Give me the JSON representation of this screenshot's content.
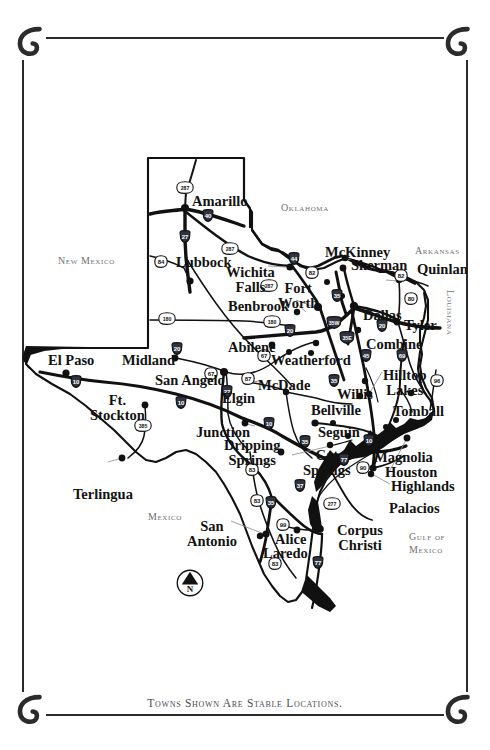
{
  "document": {
    "title": "Texas Map — Towns Shown Are Stable Locations",
    "caption": "Towns Shown Are Stable Locations.",
    "background_color": "#ffffff",
    "ink_color": "#121212",
    "label_gray": "#6f6f72"
  },
  "frame": {
    "ornament": "horseshoe",
    "corners": [
      "top-left",
      "top-right",
      "bottom-left",
      "bottom-right"
    ]
  },
  "compass": {
    "label": "N",
    "type": "north-arrow"
  },
  "regions": [
    {
      "name": "New Mexico",
      "label": "New Mexico",
      "x": 58,
      "y": 256,
      "rotate": 0
    },
    {
      "name": "Oklahoma",
      "label": "Oklahoma",
      "x": 281,
      "y": 203,
      "rotate": 0
    },
    {
      "name": "Arkansas",
      "label": "Arkansas",
      "x": 415,
      "y": 246,
      "rotate": 0
    },
    {
      "name": "Louisiana",
      "label": "Louisiana",
      "x": 455,
      "y": 290,
      "rotate": 90
    },
    {
      "name": "Mexico",
      "label": "Mexico",
      "x": 148,
      "y": 512,
      "rotate": 0
    },
    {
      "name": "Gulf of Mexico",
      "label": "Gulf of",
      "x": 409,
      "y": 532,
      "rotate": 0
    },
    {
      "name": "Gulf of Mexico2",
      "label": "Mexico",
      "x": 409,
      "y": 545,
      "rotate": 0
    }
  ],
  "cities": [
    {
      "name": "Amarillo",
      "label": "Amarillo",
      "lx": 192,
      "ly": 194,
      "dx": 185,
      "dy": 208
    },
    {
      "name": "Lubbock",
      "label": "Lubbock",
      "lx": 176,
      "ly": 255,
      "dx": 190,
      "dy": 281
    },
    {
      "name": "Wichita Falls",
      "label": "Wichita\nFalls",
      "lx": 226,
      "ly": 265,
      "dx": 290,
      "dy": 267
    },
    {
      "name": "Fort Worth",
      "label": "Fort\nWorth",
      "lx": 278,
      "ly": 281,
      "dx": 318,
      "dy": 307
    },
    {
      "name": "Benbrook",
      "label": "Benbrook",
      "lx": 228,
      "ly": 299,
      "dx": 297,
      "dy": 312
    },
    {
      "name": "McKinney",
      "label": "McKinney",
      "lx": 325,
      "ly": 245,
      "dx": 343,
      "dy": 268
    },
    {
      "name": "Sherman",
      "label": "Sherman",
      "lx": 351,
      "ly": 258,
      "dx": 345,
      "dy": 258
    },
    {
      "name": "Quinlan",
      "label": "Quinlan",
      "lx": 417,
      "ly": 262,
      "dx": 399,
      "dy": 280
    },
    {
      "name": "Dallas",
      "label": "Dallas",
      "lx": 363,
      "ly": 308,
      "dx": 354,
      "dy": 306
    },
    {
      "name": "Tyler",
      "label": "Tyler",
      "lx": 404,
      "ly": 318,
      "dx": 397,
      "dy": 322
    },
    {
      "name": "Combine",
      "label": "Combine",
      "lx": 366,
      "ly": 337,
      "dx": 358,
      "dy": 330
    },
    {
      "name": "El Paso",
      "label": "El Paso",
      "lx": 48,
      "ly": 353,
      "dx": 66,
      "dy": 373
    },
    {
      "name": "Midland",
      "label": "Midland",
      "lx": 122,
      "ly": 353,
      "dx": 175,
      "dy": 358
    },
    {
      "name": "Abilene",
      "label": "Abilene",
      "lx": 228,
      "ly": 340,
      "dx": 272,
      "dy": 345
    },
    {
      "name": "Weatherford",
      "label": "Weatherford",
      "lx": 271,
      "ly": 353,
      "dx": 316,
      "dy": 343
    },
    {
      "name": "San Angelo",
      "label": "San Angelo",
      "lx": 155,
      "ly": 373,
      "dx": 224,
      "dy": 372
    },
    {
      "name": "McDade",
      "label": "McDade",
      "lx": 258,
      "ly": 378,
      "dx": 248,
      "dy": 380
    },
    {
      "name": "Elgin",
      "label": "Elgin",
      "lx": 222,
      "ly": 391,
      "dx": 286,
      "dy": 392
    },
    {
      "name": "Willis",
      "label": "Willis",
      "lx": 337,
      "ly": 387,
      "dx": 365,
      "dy": 381
    },
    {
      "name": "Hilltop Lakes",
      "label": "Hilltop\nLakes",
      "lx": 383,
      "ly": 368,
      "dx": 369,
      "dy": 394
    },
    {
      "name": "Bellville",
      "label": "Bellville",
      "lx": 311,
      "ly": 403,
      "dx": 360,
      "dy": 396
    },
    {
      "name": "Tomball",
      "label": "Tomball",
      "lx": 393,
      "ly": 404,
      "dx": 411,
      "dy": 393
    },
    {
      "name": "Ft. Stockton",
      "label": "Ft.\nStockton",
      "lx": 90,
      "ly": 393,
      "dx": 145,
      "dy": 405
    },
    {
      "name": "Junction",
      "label": "Junction",
      "lx": 196,
      "ly": 425,
      "dx": 245,
      "dy": 423
    },
    {
      "name": "Dripping Springs",
      "label": "Dripping\nSprings",
      "lx": 224,
      "ly": 438,
      "dx": 281,
      "dy": 452
    },
    {
      "name": "Seguin",
      "label": "Seguin",
      "lx": 318,
      "ly": 425,
      "dx": 315,
      "dy": 423
    },
    {
      "name": "Cat Springs",
      "label": "Cat\nSprings",
      "lx": 303,
      "ly": 448,
      "dx": 330,
      "dy": 445
    },
    {
      "name": "Magnolia",
      "label": "Magnolia",
      "lx": 374,
      "ly": 450,
      "dx": 352,
      "dy": 452
    },
    {
      "name": "Houston",
      "label": "Houston",
      "lx": 385,
      "ly": 465,
      "dx": 373,
      "dy": 468
    },
    {
      "name": "Highlands",
      "label": "Highlands",
      "lx": 391,
      "ly": 479,
      "dx": 407,
      "dy": 438
    },
    {
      "name": "Palacios",
      "label": "Palacios",
      "lx": 389,
      "ly": 501,
      "dx": 371,
      "dy": 474
    },
    {
      "name": "Terlingua",
      "label": "Terlingua",
      "lx": 73,
      "ly": 487,
      "dx": 122,
      "dy": 458
    },
    {
      "name": "San Antonio",
      "label": "San\nAntonio",
      "lx": 187,
      "ly": 519,
      "dx": 266,
      "dy": 534
    },
    {
      "name": "Alice",
      "label": "Alice",
      "lx": 275,
      "ly": 532,
      "dx": 297,
      "dy": 530
    },
    {
      "name": "Laredo",
      "label": "Laredo",
      "lx": 263,
      "ly": 546,
      "dx": 260,
      "dy": 536
    },
    {
      "name": "Corpus Christi",
      "label": "Corpus\nChristi",
      "lx": 337,
      "ly": 523,
      "dx": 320,
      "dy": 529
    }
  ],
  "highway_shields": [
    {
      "type": "us",
      "number": "287",
      "x": 185,
      "y": 187
    },
    {
      "type": "interstate",
      "number": "40",
      "x": 208,
      "y": 215
    },
    {
      "type": "interstate",
      "number": "27",
      "x": 185,
      "y": 236
    },
    {
      "type": "us",
      "number": "84",
      "x": 161,
      "y": 261
    },
    {
      "type": "us",
      "number": "287",
      "x": 230,
      "y": 248
    },
    {
      "type": "interstate",
      "number": "44",
      "x": 294,
      "y": 258
    },
    {
      "type": "us",
      "number": "82",
      "x": 312,
      "y": 272
    },
    {
      "type": "us",
      "number": "82",
      "x": 401,
      "y": 275
    },
    {
      "type": "us",
      "number": "287",
      "x": 269,
      "y": 285
    },
    {
      "type": "interstate",
      "number": "35",
      "x": 337,
      "y": 295
    },
    {
      "type": "us",
      "number": "80",
      "x": 411,
      "y": 298
    },
    {
      "type": "us",
      "number": "180",
      "x": 167,
      "y": 318
    },
    {
      "type": "us",
      "number": "180",
      "x": 272,
      "y": 321
    },
    {
      "type": "interstate",
      "number": "20",
      "x": 290,
      "y": 330
    },
    {
      "type": "interstate",
      "number": "35W",
      "x": 334,
      "y": 322
    },
    {
      "type": "interstate",
      "number": "35E",
      "x": 347,
      "y": 337
    },
    {
      "type": "interstate",
      "number": "20",
      "x": 382,
      "y": 325
    },
    {
      "type": "interstate",
      "number": "20",
      "x": 177,
      "y": 348
    },
    {
      "type": "us",
      "number": "67",
      "x": 264,
      "y": 355
    },
    {
      "type": "us",
      "number": "67",
      "x": 211,
      "y": 373
    },
    {
      "type": "us",
      "number": "87",
      "x": 248,
      "y": 378
    },
    {
      "type": "interstate",
      "number": "45",
      "x": 366,
      "y": 355
    },
    {
      "type": "interstate",
      "number": "69",
      "x": 402,
      "y": 355
    },
    {
      "type": "interstate",
      "number": "35",
      "x": 334,
      "y": 380
    },
    {
      "type": "us",
      "number": "96",
      "x": 437,
      "y": 380
    },
    {
      "type": "interstate",
      "number": "27",
      "x": 227,
      "y": 391
    },
    {
      "type": "interstate",
      "number": "10",
      "x": 76,
      "y": 381
    },
    {
      "type": "interstate",
      "number": "10",
      "x": 181,
      "y": 402
    },
    {
      "type": "us",
      "number": "385",
      "x": 143,
      "y": 425
    },
    {
      "type": "interstate",
      "number": "10",
      "x": 269,
      "y": 423
    },
    {
      "type": "interstate",
      "number": "35",
      "x": 305,
      "y": 441
    },
    {
      "type": "interstate",
      "number": "10",
      "x": 369,
      "y": 440
    },
    {
      "type": "interstate",
      "number": "77",
      "x": 344,
      "y": 459
    },
    {
      "type": "us",
      "number": "90",
      "x": 363,
      "y": 467
    },
    {
      "type": "us",
      "number": "83",
      "x": 252,
      "y": 469
    },
    {
      "type": "interstate",
      "number": "37",
      "x": 300,
      "y": 485
    },
    {
      "type": "us",
      "number": "277",
      "x": 332,
      "y": 503
    },
    {
      "type": "us",
      "number": "83",
      "x": 257,
      "y": 500
    },
    {
      "type": "interstate",
      "number": "35",
      "x": 271,
      "y": 502
    },
    {
      "type": "us",
      "number": "99",
      "x": 283,
      "y": 524
    },
    {
      "type": "us",
      "number": "83",
      "x": 275,
      "y": 563
    },
    {
      "type": "interstate",
      "number": "77",
      "x": 318,
      "y": 562
    }
  ]
}
